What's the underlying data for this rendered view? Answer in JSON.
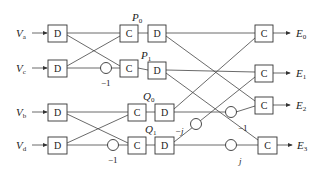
{
  "diagram": {
    "type": "signal-flow block diagram",
    "inputs": [
      {
        "label": "V",
        "sub": "a"
      },
      {
        "label": "V",
        "sub": "c"
      },
      {
        "label": "V",
        "sub": "b"
      },
      {
        "label": "V",
        "sub": "d"
      }
    ],
    "outputs": [
      {
        "label": "E",
        "sub": "0"
      },
      {
        "label": "E",
        "sub": "1"
      },
      {
        "label": "E",
        "sub": "2"
      },
      {
        "label": "E",
        "sub": "3"
      }
    ],
    "intermediate": [
      {
        "label": "P",
        "sub": "0"
      },
      {
        "label": "P",
        "sub": "1"
      },
      {
        "label": "Q",
        "sub": "0"
      },
      {
        "label": "Q",
        "sub": "1"
      }
    ],
    "block_labels": {
      "delay": "D",
      "combine": "C"
    },
    "coefficients": {
      "stage1_top": "−1",
      "stage1_bottom": "−1",
      "stage2_neg_j": "−j",
      "stage2_neg_one": "−1",
      "stage2_j": "j"
    }
  }
}
